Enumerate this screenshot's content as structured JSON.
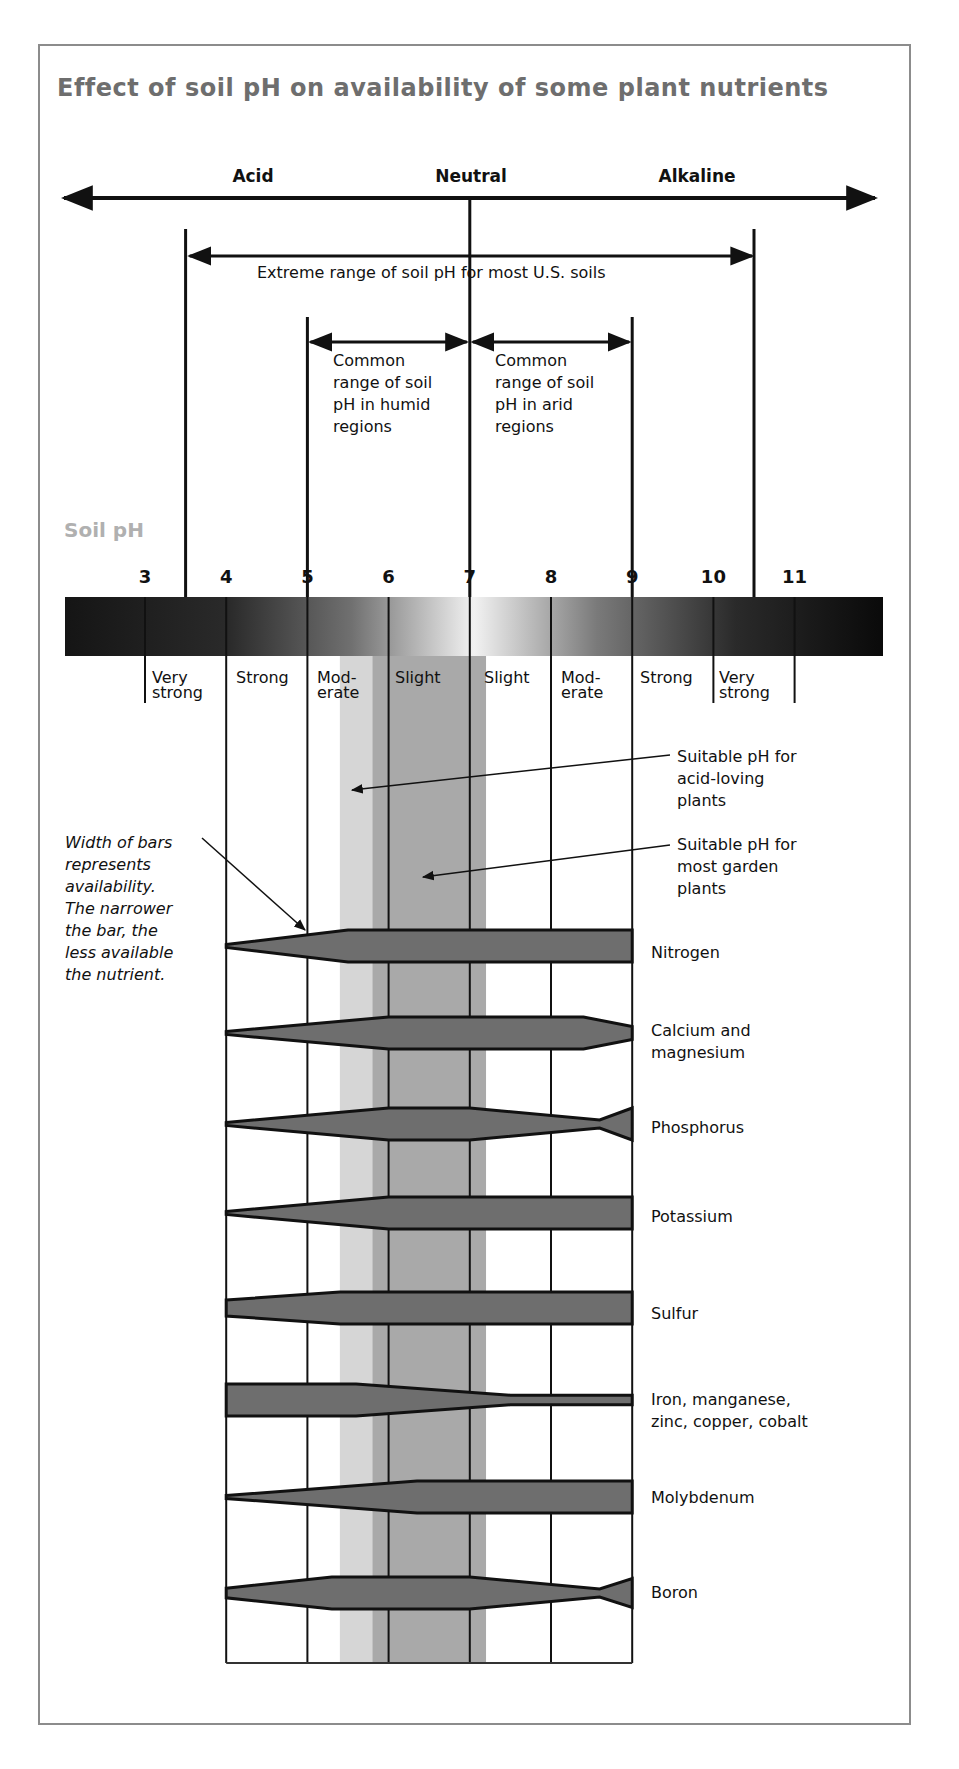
{
  "title": "Effect of soil pH on availability of some plant nutrients",
  "scale": {
    "Acid": "Acid",
    "Neutral": "Neutral",
    "Alkaline": "Alkaline"
  },
  "ranges": {
    "extreme": "Extreme range of soil pH for most U.S. soils",
    "humid": "Common\nrange of soil\npH in humid\nregions",
    "arid": "Common\nrange of soil\npH in arid\nregions"
  },
  "soil_ph_label": "Soil pH",
  "ph_ticks": [
    "3",
    "4",
    "5",
    "6",
    "7",
    "8",
    "9",
    "10",
    "11"
  ],
  "zones": [
    {
      "label": "Very\nstrong",
      "x": 152
    },
    {
      "label": "Strong",
      "x": 236
    },
    {
      "label": "Mod-\nerate",
      "x": 317
    },
    {
      "label": "Slight",
      "x": 395
    },
    {
      "label": "Slight",
      "x": 484
    },
    {
      "label": "Mod-\nerate",
      "x": 561
    },
    {
      "label": "Strong",
      "x": 640
    },
    {
      "label": "Very\nstrong",
      "x": 719
    }
  ],
  "annotations": {
    "acid_loving": "Suitable pH for\nacid-loving\nplants",
    "garden": "Suitable pH for\nmost garden\nplants",
    "width_note": "Width of bars\nrepresents\navailability.\nThe narrower\nthe bar, the\nless available\nthe nutrient."
  },
  "nutrients": [
    {
      "name": "Nitrogen",
      "label_y": 942
    },
    {
      "name": "Calcium and\nmagnesium",
      "label_y": 1020
    },
    {
      "name": "Phosphorus",
      "label_y": 1117
    },
    {
      "name": "Potassium",
      "label_y": 1206
    },
    {
      "name": "Sulfur",
      "label_y": 1303
    },
    {
      "name": "Iron, manganese,\nzinc, copper, cobalt",
      "label_y": 1389
    },
    {
      "name": "Molybdenum",
      "label_y": 1487
    },
    {
      "name": "Boron",
      "label_y": 1582
    }
  ],
  "colors": {
    "bar_fill": "#6e6e6e",
    "acid_band": "#d6d6d6",
    "garden_band": "#a9a9a9",
    "title": "#6e6e6e",
    "soil_ph": "#b0b0b0"
  },
  "chart_data": {
    "type": "area",
    "title": "Effect of soil pH on availability of some plant nutrients",
    "xlabel": "Soil pH",
    "x_ticks": [
      3,
      4,
      5,
      6,
      7,
      8,
      9,
      10,
      11
    ],
    "xlim": [
      2.2,
      11.5
    ],
    "scale_labels": {
      "Acid": "< 7",
      "Neutral": 7,
      "Alkaline": "> 7"
    },
    "ranges": [
      {
        "name": "Extreme range of soil pH for most U.S. soils",
        "from": 3.5,
        "to": 10.5
      },
      {
        "name": "Common range of soil pH in humid regions",
        "from": 5,
        "to": 7
      },
      {
        "name": "Common range of soil pH in arid regions",
        "from": 7,
        "to": 9
      }
    ],
    "acidity_zones": [
      {
        "label": "Very strong",
        "from": 3,
        "to": 4
      },
      {
        "label": "Strong",
        "from": 4,
        "to": 5
      },
      {
        "label": "Moderate",
        "from": 5,
        "to": 6
      },
      {
        "label": "Slight",
        "from": 6,
        "to": 7
      },
      {
        "label": "Slight",
        "from": 7,
        "to": 8
      },
      {
        "label": "Moderate",
        "from": 8,
        "to": 9
      },
      {
        "label": "Strong",
        "from": 9,
        "to": 10
      },
      {
        "label": "Very strong",
        "from": 10,
        "to": 11
      }
    ],
    "bands": [
      {
        "name": "Suitable pH for acid-loving plants",
        "from": 5.4,
        "to": 5.8
      },
      {
        "name": "Suitable pH for most garden plants",
        "from": 5.8,
        "to": 7.2
      }
    ],
    "note": "Width of bars represents availability. The narrower the bar, the less available the nutrient.",
    "series": [
      {
        "name": "Nitrogen",
        "x": [
          4,
          5.5,
          9
        ],
        "availability": [
          0.05,
          1.0,
          1.0
        ]
      },
      {
        "name": "Calcium and magnesium",
        "x": [
          4,
          6,
          8.4,
          9
        ],
        "availability": [
          0.05,
          1.0,
          1.0,
          0.4
        ]
      },
      {
        "name": "Phosphorus",
        "x": [
          4,
          6,
          7,
          8.6,
          9
        ],
        "availability": [
          0.05,
          1.0,
          1.0,
          0.25,
          1.0
        ]
      },
      {
        "name": "Potassium",
        "x": [
          4,
          6,
          9
        ],
        "availability": [
          0.05,
          1.0,
          1.0
        ]
      },
      {
        "name": "Sulfur",
        "x": [
          4,
          5.4,
          9
        ],
        "availability": [
          0.5,
          1.0,
          1.0
        ]
      },
      {
        "name": "Iron, manganese, zinc, copper, cobalt",
        "x": [
          4,
          5.6,
          7.5,
          9
        ],
        "availability": [
          1.0,
          1.0,
          0.3,
          0.3
        ]
      },
      {
        "name": "Molybdenum",
        "x": [
          4,
          6.35,
          9
        ],
        "availability": [
          0.05,
          1.0,
          1.0
        ]
      },
      {
        "name": "Boron",
        "x": [
          4,
          5.3,
          7,
          8.6,
          9
        ],
        "availability": [
          0.3,
          1.0,
          1.0,
          0.25,
          0.9
        ]
      }
    ]
  }
}
